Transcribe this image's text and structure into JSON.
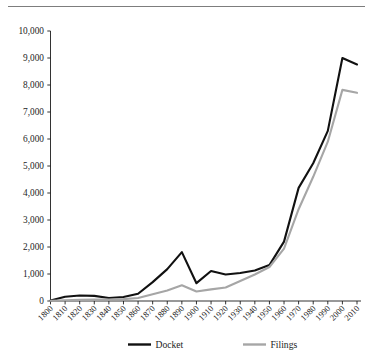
{
  "page": {
    "background_color": "#ffffff",
    "rule_color": "#7d7d7d"
  },
  "chart_data": {
    "type": "line",
    "title": "",
    "subtitle": "",
    "xlabel": "",
    "ylabel": "",
    "xlim": [
      1800,
      2010
    ],
    "ylim": [
      0,
      10000
    ],
    "grid": false,
    "legend_position": "bottom",
    "x": [
      1800,
      1810,
      1820,
      1830,
      1840,
      1850,
      1860,
      1870,
      1880,
      1890,
      1900,
      1910,
      1920,
      1930,
      1940,
      1950,
      1960,
      1970,
      1980,
      1990,
      2000,
      2010
    ],
    "categories": [
      "1800",
      "1810",
      "1820",
      "1830",
      "1840",
      "1850",
      "1860",
      "1870",
      "1880",
      "1890",
      "1900",
      "1910",
      "1920",
      "1930",
      "1940",
      "1950",
      "1960",
      "1970",
      "1980",
      "1990",
      "2000",
      "2010"
    ],
    "series": [
      {
        "name": "Docket",
        "color": "#111111",
        "width": 2.1,
        "values": [
          20,
          160,
          205,
          190,
          110,
          150,
          270,
          700,
          1180,
          1810,
          660,
          1110,
          980,
          1040,
          1130,
          1330,
          2200,
          4190,
          5100,
          6300,
          9000,
          8760
        ]
      },
      {
        "name": "Filings",
        "color": "#a6a6a6",
        "width": 2.1,
        "values": [
          10,
          25,
          40,
          50,
          55,
          70,
          110,
          250,
          390,
          580,
          350,
          430,
          500,
          740,
          980,
          1260,
          1940,
          3400,
          4600,
          5900,
          7820,
          7710
        ]
      }
    ],
    "yticks": [
      0,
      1000,
      2000,
      3000,
      4000,
      5000,
      6000,
      7000,
      8000,
      9000,
      10000
    ],
    "ytick_labels": [
      "0",
      "1,000",
      "2,000",
      "3,000",
      "4,000",
      "5,000",
      "6,000",
      "7,000",
      "8,000",
      "9,000",
      "10,000"
    ],
    "xticks": [
      1800,
      1810,
      1820,
      1830,
      1840,
      1850,
      1860,
      1870,
      1880,
      1890,
      1900,
      1910,
      1920,
      1930,
      1940,
      1950,
      1960,
      1970,
      1980,
      1990,
      2000,
      2010
    ],
    "xtick_labels": [
      "1800",
      "1810",
      "1820",
      "1830",
      "1840",
      "1850",
      "1860",
      "1870",
      "1880",
      "1890",
      "1900",
      "1910",
      "1920",
      "1930",
      "1940",
      "1950",
      "1960",
      "1970",
      "1980",
      "1990",
      "2000",
      "2010"
    ],
    "xtick_rotation": -45,
    "legend": [
      {
        "label": "Docket",
        "color": "#111111"
      },
      {
        "label": "Filings",
        "color": "#a6a6a6"
      }
    ]
  }
}
